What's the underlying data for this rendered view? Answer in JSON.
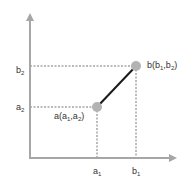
{
  "diagram": {
    "type": "coordinate-plot",
    "axes": {
      "color": "#a6a6a6",
      "x_axis": {
        "x1": 30,
        "x2": 176,
        "y": 158
      },
      "y_axis": {
        "x": 30,
        "y1": 14,
        "y2": 158
      }
    },
    "segment": {
      "from": "a",
      "to": "b",
      "color": "#1a1a1a"
    },
    "points": [
      {
        "id": "a",
        "label": "a(a1,a2)",
        "x": 97,
        "y": 107,
        "color": "#b3b3b3"
      },
      {
        "id": "b",
        "label": "b(b1,b2)",
        "x": 136,
        "y": 66,
        "color": "#b3b3b3"
      }
    ],
    "tick_labels": {
      "x": [
        {
          "text": "a",
          "sub": "1",
          "x": 97
        },
        {
          "text": "b",
          "sub": "1",
          "x": 136
        }
      ],
      "y": [
        {
          "text": "b",
          "sub": "2",
          "y": 71
        },
        {
          "text": "a",
          "sub": "2",
          "y": 108
        }
      ]
    },
    "point_labels": {
      "a": {
        "main": "a(a",
        "sub1": "1",
        "sep": ",a",
        "sub2": "2",
        "close": ")"
      },
      "b": {
        "main": "b(b",
        "sub1": "1",
        "sep": ",b",
        "sub2": "2",
        "close": ")"
      }
    },
    "dashed_color": "#555555"
  }
}
